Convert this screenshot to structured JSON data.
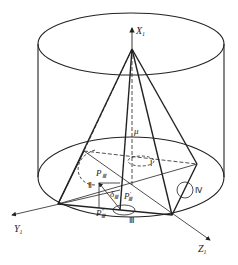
{
  "diagram": {
    "type": "3D geometric schematic: pyramid inscribed in cylinder",
    "axes": {
      "x": {
        "label": "X",
        "sub": "1"
      },
      "y": {
        "label": "Y",
        "sub": "1"
      },
      "z": {
        "label": "Z",
        "sub": "1"
      }
    },
    "angle_labels": {
      "mu": "μ",
      "delta": "δ",
      "delta_sub": "Ⅲ"
    },
    "points": {
      "p3": {
        "label": "P",
        "sub": "Ⅲ"
      },
      "p3_prime": {
        "label": "P",
        "sub": "Ⅲ",
        "sup": "′"
      },
      "p3_dprime": {
        "label": "P",
        "sub": "Ⅲ",
        "sup": "″"
      }
    },
    "regions": [
      "Ⅰ",
      "Ⅱ",
      "Ⅲ",
      "Ⅳ"
    ],
    "colors": {
      "line": "#222222",
      "background": "#ffffff"
    }
  }
}
